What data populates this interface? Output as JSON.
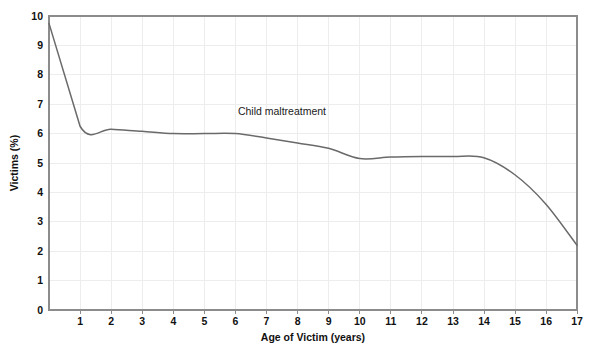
{
  "chart_data": {
    "type": "line",
    "title": "",
    "xlabel": "Age of Victim (years)",
    "ylabel": "Victims (%)",
    "xlim": [
      0,
      17
    ],
    "ylim": [
      0,
      10
    ],
    "grid": true,
    "legend_position": "inline-annotation",
    "line_color": "#6a6a6a",
    "grid_color": "#ededed",
    "border_color": "#8c8c8c",
    "xticks": [
      0,
      1,
      2,
      3,
      4,
      5,
      6,
      7,
      8,
      9,
      10,
      11,
      12,
      13,
      14,
      15,
      16,
      17
    ],
    "xtick_labels": [
      "0",
      "1",
      "2",
      "3",
      "4",
      "5",
      "6",
      "7",
      "8",
      "9",
      "10",
      "11",
      "12",
      "13",
      "14",
      "15",
      "16",
      "17"
    ],
    "yticks": [
      0,
      1,
      2,
      3,
      4,
      5,
      6,
      7,
      8,
      9,
      10
    ],
    "ytick_labels": [
      "0",
      "1",
      "2",
      "3",
      "4",
      "5",
      "6",
      "7",
      "8",
      "9",
      "10"
    ],
    "annotations": [
      {
        "text": "Child maltreatment",
        "x": 7.5,
        "y": 6.62
      }
    ],
    "series": [
      {
        "name": "Child maltreatment",
        "x": [
          0,
          1,
          2,
          3,
          4,
          5,
          6,
          7,
          8,
          9,
          10,
          11,
          12,
          13,
          14,
          15,
          16,
          17
        ],
        "values": [
          9.75,
          6.25,
          6.15,
          6.08,
          6.0,
          6.0,
          6.0,
          5.85,
          5.68,
          5.5,
          5.15,
          5.2,
          5.22,
          5.22,
          5.18,
          4.6,
          3.6,
          2.2
        ]
      }
    ]
  },
  "caption": {
    "text": ""
  }
}
